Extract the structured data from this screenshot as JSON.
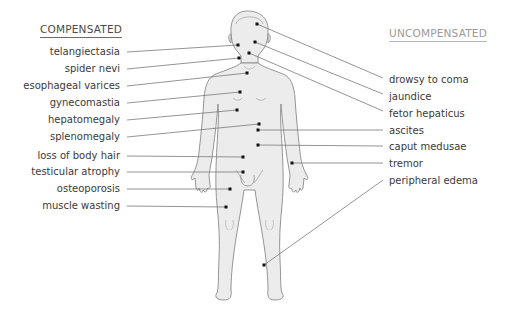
{
  "headings": {
    "compensated": "COMPENSATED",
    "uncompensated": "UNCOMPENSATED"
  },
  "compensated_signs": [
    {
      "label": "telangiectasia",
      "label_y": 46,
      "dot": [
        238,
        45
      ]
    },
    {
      "label": "spider nevi",
      "label_y": 63,
      "dot": [
        239,
        58
      ]
    },
    {
      "label": "esophageal varices",
      "label_y": 80,
      "dot": [
        247,
        73
      ]
    },
    {
      "label": "gynecomastia",
      "label_y": 97,
      "dot": [
        240,
        92
      ]
    },
    {
      "label": "hepatomegaly",
      "label_y": 114,
      "dot": [
        237,
        110
      ]
    },
    {
      "label": "splenomegaly",
      "label_y": 131,
      "dot": [
        259,
        124
      ]
    },
    {
      "label": "loss of body hair",
      "label_y": 148,
      "dot": [
        243,
        157
      ]
    },
    {
      "label": "testicular atrophy",
      "label_y": 165,
      "dot": [
        243,
        172
      ]
    },
    {
      "label": "osteoporosis",
      "label_y": 182,
      "dot": [
        230,
        189
      ]
    },
    {
      "label": "muscle wasting",
      "label_y": 199,
      "dot": [
        226,
        207
      ]
    }
  ],
  "uncompensated_signs": [
    {
      "label": "drowsy to coma",
      "label_y": 72,
      "dot": [
        257,
        24
      ]
    },
    {
      "label": "jaundice",
      "label_y": 89,
      "dot": [
        255,
        42
      ]
    },
    {
      "label": "fetor hepaticus",
      "label_y": 106,
      "dot": [
        249,
        53
      ]
    },
    {
      "label": "ascites",
      "label_y": 123,
      "dot": [
        258,
        130
      ]
    },
    {
      "label": "caput medusae",
      "label_y": 140,
      "dot": [
        258,
        145
      ]
    },
    {
      "label": "tremor",
      "label_y": 157,
      "dot": [
        292,
        163
      ]
    },
    {
      "label": "peripheral edema",
      "label_y": 174,
      "dot": [
        264,
        265
      ]
    }
  ],
  "colors": {
    "body_fill": "#ececec",
    "body_stroke": "#8a8a8a",
    "leader_line": "#7a7a7a",
    "dot": "#111111",
    "text": "#3a3a3a"
  }
}
